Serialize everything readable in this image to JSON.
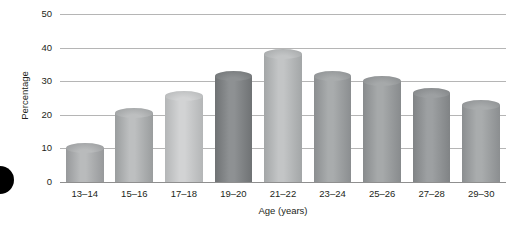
{
  "chart_data": {
    "type": "bar",
    "title": "",
    "xlabel": "Age (years)",
    "ylabel": "Percentage",
    "categories": [
      "13–14",
      "15–16",
      "17–18",
      "19–20",
      "21–22",
      "23–24",
      "25–26",
      "27–28",
      "29–30"
    ],
    "values": [
      11.5,
      22,
      27,
      33,
      39.5,
      33,
      31.5,
      28,
      24.5
    ],
    "ylim": [
      0,
      50
    ],
    "yticks": [
      0,
      10,
      20,
      30,
      40,
      50
    ],
    "ytick_labels": [
      "0",
      "10",
      "20",
      "30",
      "40",
      "50"
    ],
    "grid": true,
    "legend": "none",
    "bar_style": "cylinder",
    "bar_colors_top": [
      "#b9bbbc",
      "#bdbfc0",
      "#d2d3d4",
      "#8e9193",
      "#c3c5c6",
      "#a9acad",
      "#a6a9aa",
      "#9da0a2",
      "#a9acad"
    ],
    "bar_colors_bottom": [
      "#97999b",
      "#9a9d9e",
      "#b4b6b7",
      "#6f7274",
      "#a3a6a7",
      "#8b8e90",
      "#888b8d",
      "#808385",
      "#8b8e90"
    ],
    "colors": {
      "gridline": "#b5b5b5",
      "baseline": "#8f8f8f",
      "text": "#231f20",
      "background": "#ffffff",
      "bullet": "#000000"
    }
  }
}
